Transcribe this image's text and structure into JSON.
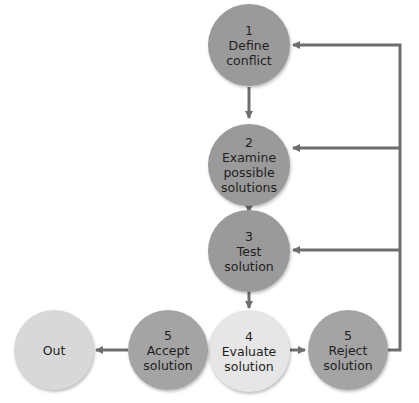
{
  "nodes": [
    {
      "id": "define",
      "number": "1",
      "line1": "Define",
      "line2": "conflict",
      "line3": ""
    },
    {
      "id": "examine",
      "number": "2",
      "line1": "Examine",
      "line2": "possible",
      "line3": "solutions"
    },
    {
      "id": "test",
      "number": "3",
      "line1": "Test",
      "line2": "solution",
      "line3": ""
    },
    {
      "id": "evaluate",
      "number": "4",
      "line1": "Evaluate",
      "line2": "solution",
      "line3": ""
    },
    {
      "id": "reject",
      "number": "5",
      "line1": "Reject",
      "line2": "solution",
      "line3": ""
    },
    {
      "id": "accept",
      "number": "5",
      "line1": "Accept",
      "line2": "solution",
      "line3": ""
    },
    {
      "id": "out",
      "number": "",
      "line1": "Out",
      "line2": "",
      "line3": ""
    }
  ],
  "colors": {
    "arrow": "#6e6e6e",
    "dark_node": "#9a9a9a",
    "light_node": "#d8d8d8",
    "evaluate_node": "#e6e6e6"
  }
}
